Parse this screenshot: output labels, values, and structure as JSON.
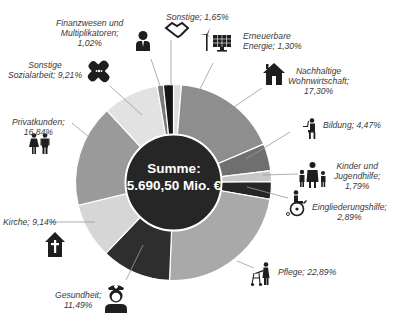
{
  "chart_data": {
    "type": "pie",
    "subtype": "donut",
    "title": "",
    "center_label": {
      "line1": "Summe:",
      "line2": "5.690,50 Mio. €"
    },
    "categories": [
      "Erneuerbare Energie",
      "Nachhaltige Wohnwirtschaft",
      "Bildung",
      "Kinder und Jugendhilfe",
      "Eingliederungshilfe",
      "Pflege",
      "Gesundheit",
      "Kirche",
      "Privatkunden",
      "Sonstige Sozialarbeit",
      "Finanzwesen und Multiplikatoren",
      "Sonstige"
    ],
    "values": [
      1.3,
      17.3,
      4.47,
      1.79,
      2.89,
      22.89,
      11.49,
      9.14,
      16.84,
      9.21,
      1.02,
      1.65
    ],
    "unit": "%",
    "colors": [
      "#dcdcdc",
      "#8e8e8e",
      "#6f6f6f",
      "#c8c8c8",
      "#262626",
      "#a9a9a9",
      "#2e2e2e",
      "#d6d6d6",
      "#9a9a9a",
      "#e2e2e2",
      "#7a7a7a",
      "#151515"
    ],
    "start_angle_deg": 0,
    "direction": "clockwise",
    "legend": "none (callout labels with icons)"
  },
  "labels": [
    {
      "key": "erneuerbare",
      "text": "Erneuerbare\nEnergie; 1,30%",
      "icon": "wind-solar-icon"
    },
    {
      "key": "nachhaltige",
      "text": "Nachhaltige\nWohnwirtschaft;\n17,30%",
      "icon": "house-icon"
    },
    {
      "key": "bildung",
      "text": "Bildung; 4,47%",
      "icon": "student-desk-icon"
    },
    {
      "key": "kinder",
      "text": "Kinder und\nJugendhilfe;\n1,79%",
      "icon": "family-icon"
    },
    {
      "key": "eingliederung",
      "text": "Eingliederungshilfe;\n2,89%",
      "icon": "wheelchair-icon"
    },
    {
      "key": "pflege",
      "text": "Pflege; 22,89%",
      "icon": "elderly-walker-icon"
    },
    {
      "key": "gesundheit",
      "text": "Gesundheit;\n11,49%",
      "icon": "nurse-icon"
    },
    {
      "key": "kirche",
      "text": "Kirche; 9,14%",
      "icon": "church-icon"
    },
    {
      "key": "privatkunden",
      "text": "Privatkunden;\n16,84%",
      "icon": "couple-icon"
    },
    {
      "key": "sozialarbeit",
      "text": "Sonstige\nSozialarbeit; 9,21%",
      "icon": "bandage-icon"
    },
    {
      "key": "finanzwesen",
      "text": "Finanzwesen und\nMultiplikatoren;\n1,02%",
      "icon": "businessman-icon"
    },
    {
      "key": "sonstige",
      "text": "Sonstige; 1,65%",
      "icon": "handshake-icon"
    }
  ]
}
